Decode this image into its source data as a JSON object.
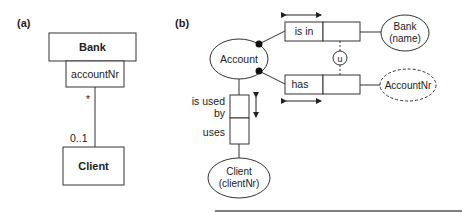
{
  "panel_a": {
    "label": "(a)",
    "bank_class": "Bank",
    "qualifier": "accountNr",
    "multiplicity_top": "*",
    "multiplicity_bottom": "0..1",
    "client_class": "Client"
  },
  "panel_b": {
    "label": "(b)",
    "account": "Account",
    "fact_is_in": "is in",
    "fact_has": "has",
    "bank_line1": "Bank",
    "bank_line2": "(name)",
    "accountnr": "AccountNr",
    "uniqueness": "u",
    "is_used_by_line1": "is used",
    "is_used_by_line2": "by",
    "uses": "uses",
    "client_line1": "Client",
    "client_line2": "(clientNr)"
  },
  "colors": {
    "stroke": "#333333",
    "background": "#ffffff"
  }
}
